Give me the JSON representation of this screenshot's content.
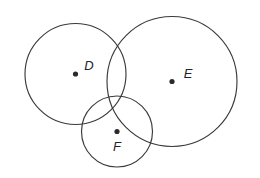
{
  "figure": {
    "background_color": "#ffffff",
    "stroke_color": "#3a3a3e",
    "dot_color": "#2b2b2f",
    "label_color": "#232327",
    "width": 260,
    "height": 178
  },
  "chart_data": {
    "type": "diagram",
    "shape": "circle",
    "title": "",
    "xlabel": "",
    "ylabel": "",
    "xlim": [
      0,
      260
    ],
    "ylim": [
      0,
      178
    ],
    "grid": false,
    "legend": "none",
    "units": "pixels",
    "circles": [
      {
        "label": "D",
        "cx": 75.5,
        "cy": 74,
        "r": 50.5,
        "label_x": 89,
        "label_y": 67,
        "dot_r": 2.6
      },
      {
        "label": "E",
        "cx": 172,
        "cy": 81.5,
        "r": 65,
        "label_x": 188,
        "label_y": 75,
        "dot_r": 2.6
      },
      {
        "label": "F",
        "cx": 117,
        "cy": 131.5,
        "r": 35.5,
        "label_x": 117,
        "label_y": 148,
        "dot_r": 2.6
      }
    ]
  },
  "labels": {
    "circle_d": "D",
    "circle_e": "E",
    "circle_f": "F"
  }
}
